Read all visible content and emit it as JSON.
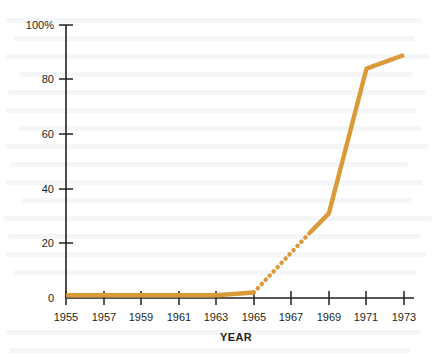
{
  "chart_data": {
    "type": "line",
    "title": "",
    "xlabel": "YEAR",
    "ylabel": "",
    "xlim": [
      1955,
      1973
    ],
    "ylim": [
      0,
      100
    ],
    "grid": false,
    "legend": null,
    "x_tick_labels": [
      "1955",
      "1957",
      "1959",
      "1961",
      "1963",
      "1965",
      "1967",
      "1969",
      "1971",
      "1973"
    ],
    "x_ticks": [
      1955,
      1957,
      1959,
      1961,
      1963,
      1965,
      1967,
      1969,
      1971,
      1973
    ],
    "y_tick_labels": [
      "0",
      "20",
      "40",
      "60",
      "80",
      "100%"
    ],
    "y_ticks": [
      0,
      20,
      40,
      60,
      80,
      100
    ],
    "series": [
      {
        "name": "percent",
        "color": "#d99a37",
        "style": "solid",
        "x": [
          1955,
          1963,
          1965
        ],
        "values": [
          1,
          1,
          2
        ]
      },
      {
        "name": "percent-estimated",
        "color": "#d99a37",
        "style": "dotted",
        "x": [
          1965,
          1968
        ],
        "values": [
          2,
          24
        ]
      },
      {
        "name": "percent-continued",
        "color": "#d99a37",
        "style": "solid",
        "x": [
          1968,
          1969,
          1971,
          1973
        ],
        "values": [
          24,
          31,
          84,
          89
        ]
      }
    ]
  },
  "colors": {
    "series": "#d99a37",
    "axis": "#231f20",
    "background": "#ffffff"
  }
}
